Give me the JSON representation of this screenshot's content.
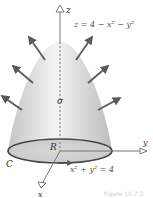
{
  "figure": {
    "surface_equation": "z = 4 − x² − y²",
    "boundary_equation": "x² + y² = 4",
    "labels": {
      "z_axis": "z",
      "y_axis": "y",
      "x_axis": "x",
      "surface": "σ",
      "region": "R",
      "curve": "C"
    },
    "caption": "Figure 15.7.3",
    "colors": {
      "surface_light": "#f2f2f2",
      "surface_dark": "#b8b8b8",
      "arrow": "#5a5a5a",
      "curve": "#444444",
      "axis": "#555555"
    }
  }
}
